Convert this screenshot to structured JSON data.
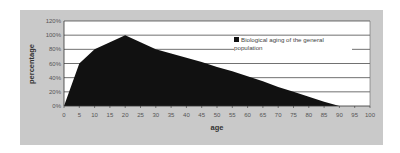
{
  "chart_data": {
    "type": "area",
    "title": "",
    "xlabel": "age",
    "ylabel": "percentage",
    "x": [
      0,
      5,
      10,
      15,
      20,
      25,
      30,
      35,
      40,
      45,
      50,
      55,
      60,
      65,
      70,
      75,
      80,
      85,
      90
    ],
    "series": [
      {
        "name": "Biological aging of the general population",
        "values": [
          0,
          60,
          80,
          90,
          100,
          90,
          80,
          74,
          68,
          62,
          55,
          49,
          42,
          35,
          27,
          20,
          13,
          6,
          0
        ],
        "color": "#111111"
      }
    ],
    "xlim": [
      0,
      100
    ],
    "ylim": [
      0,
      120
    ],
    "x_ticks": [
      "0",
      "5",
      "10",
      "15",
      "20",
      "25",
      "30",
      "35",
      "40",
      "45",
      "50",
      "55",
      "60",
      "65",
      "70",
      "75",
      "80",
      "85",
      "90",
      "95",
      "100"
    ],
    "y_ticks": [
      "0%",
      "20%",
      "40%",
      "60%",
      "80%",
      "100%",
      "120%"
    ],
    "grid": true,
    "legend_position": "upper right (inside)"
  },
  "legend": {
    "label": "Biological aging of the general population"
  },
  "colors": {
    "panel_bg": "#c9c9c9",
    "plot_bg": "#ffffff",
    "area_fill": "#111111",
    "gridline": "#333333"
  }
}
